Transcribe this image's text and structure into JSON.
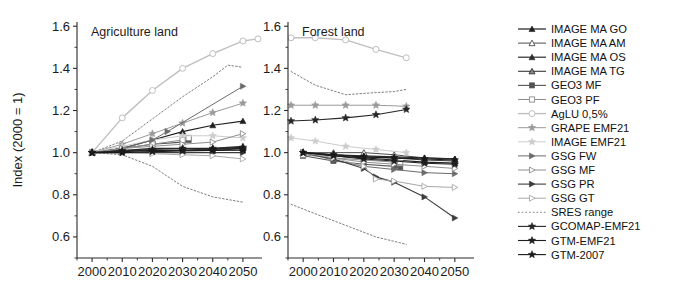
{
  "figure": {
    "ylabel": "Index (2000 = 1)",
    "y_ticks": [
      "0.6",
      "0.8",
      "1.0",
      "1.2",
      "1.4",
      "1.6"
    ],
    "ylim": [
      0.5,
      1.62
    ],
    "xlim": [
      1995,
      2055
    ],
    "x_ticks": [
      "2000",
      "2010",
      "2020",
      "2030",
      "2040",
      "2050"
    ],
    "panels": [
      {
        "id": "agriculture",
        "title": "Agriculture land"
      },
      {
        "id": "forest",
        "title": "Forest land"
      }
    ]
  },
  "legend": {
    "items": [
      {
        "label": "IMAGE MA GO",
        "marker": "triangle-filled",
        "color": "#1f1f1f",
        "line": "solid",
        "lw": 1.2
      },
      {
        "label": "IMAGE MA AM",
        "marker": "triangle-open",
        "color": "#4d4d4d",
        "line": "solid",
        "lw": 1.0
      },
      {
        "label": "IMAGE MA OS",
        "marker": "triangle-filled",
        "color": "#2b2b2b",
        "line": "solid",
        "lw": 1.2
      },
      {
        "label": "IMAGE MA TG",
        "marker": "triangle-half",
        "color": "#3a3a3a",
        "line": "solid",
        "lw": 1.1
      },
      {
        "label": "GEO3 MF",
        "marker": "square-filled",
        "color": "#555555",
        "line": "solid",
        "lw": 1.1
      },
      {
        "label": "GEO3 PF",
        "marker": "square-open",
        "color": "#8c8c8c",
        "line": "solid",
        "lw": 1.0
      },
      {
        "label": "AgLU 0,5%",
        "marker": "circle-open",
        "color": "#bfbfbf",
        "line": "solid",
        "lw": 1.4
      },
      {
        "label": "GRAPE EMF21",
        "marker": "star-grey",
        "color": "#9a9a9a",
        "line": "solid",
        "lw": 1.0
      },
      {
        "label": "IMAGE EMF21",
        "marker": "star-light",
        "color": "#cccccc",
        "line": "solid",
        "lw": 1.0
      },
      {
        "label": "GSG FW",
        "marker": "rtriangle-filled",
        "color": "#6b6b6b",
        "line": "solid",
        "lw": 1.0
      },
      {
        "label": "GSG MF",
        "marker": "rtriangle-open",
        "color": "#8f8f8f",
        "line": "solid",
        "lw": 1.0
      },
      {
        "label": "GSG PR",
        "marker": "rtriangle-filled-dark",
        "color": "#3c3c3c",
        "line": "solid",
        "lw": 1.1
      },
      {
        "label": "GSG GT",
        "marker": "rtriangle-light",
        "color": "#a8a8a8",
        "line": "solid",
        "lw": 1.0
      },
      {
        "label": "SRES range",
        "marker": "none",
        "color": "#6f6f6f",
        "line": "dotted",
        "lw": 0.9
      },
      {
        "label": "GCOMAP-EMF21",
        "marker": "star-filled",
        "color": "#262626",
        "line": "solid",
        "lw": 1.1
      },
      {
        "label": "GTM-EMF21",
        "marker": "star-filled",
        "color": "#1f1f1f",
        "line": "solid",
        "lw": 1.1
      },
      {
        "label": "GTM-2007",
        "marker": "star-filled",
        "color": "#1a1a1a",
        "line": "solid",
        "lw": 1.1
      }
    ]
  },
  "chart_data": {
    "type": "line",
    "title": "",
    "xlabel": "",
    "ylabel": "Index (2000 = 1)",
    "xlim": [
      1995,
      2055
    ],
    "ylim": [
      0.5,
      1.62
    ],
    "grid": false,
    "legend_position": "right",
    "panels": [
      {
        "name": "Agriculture land",
        "series": [
          {
            "name": "IMAGE MA GO",
            "x": [
              2000,
              2010,
              2020,
              2030,
              2040,
              2050
            ],
            "y": [
              1.0,
              1.02,
              1.06,
              1.1,
              1.13,
              1.15
            ]
          },
          {
            "name": "IMAGE MA AM",
            "x": [
              2000,
              2010,
              2020,
              2030,
              2040,
              2050
            ],
            "y": [
              1.0,
              1.01,
              1.01,
              1.01,
              1.02,
              1.02
            ]
          },
          {
            "name": "IMAGE MA OS",
            "x": [
              2000,
              2010,
              2020,
              2030,
              2040,
              2050
            ],
            "y": [
              1.0,
              1.01,
              1.02,
              1.02,
              1.02,
              1.03
            ]
          },
          {
            "name": "IMAGE MA TG",
            "x": [
              2000,
              2010,
              2020,
              2030,
              2040,
              2050
            ],
            "y": [
              1.0,
              1.01,
              1.01,
              1.01,
              1.01,
              1.02
            ]
          },
          {
            "name": "GEO3 MF",
            "x": [
              2000,
              2010,
              2020,
              2030,
              2032
            ],
            "y": [
              1.0,
              1.02,
              1.04,
              1.05,
              1.06
            ]
          },
          {
            "name": "GEO3 PF",
            "x": [
              2000,
              2010,
              2020,
              2030,
              2032
            ],
            "y": [
              1.0,
              1.02,
              1.04,
              1.06,
              1.07
            ]
          },
          {
            "name": "AgLU 0,5%",
            "x": [
              2000,
              2010,
              2020,
              2030,
              2040,
              2050,
              2055
            ],
            "y": [
              1.0,
              1.165,
              1.295,
              1.4,
              1.47,
              1.53,
              1.54
            ]
          },
          {
            "name": "GRAPE EMF21",
            "x": [
              2000,
              2010,
              2020,
              2030,
              2040,
              2050
            ],
            "y": [
              1.0,
              1.04,
              1.09,
              1.14,
              1.19,
              1.235
            ]
          },
          {
            "name": "IMAGE EMF21",
            "x": [
              2000,
              2010,
              2020,
              2030,
              2040,
              2050
            ],
            "y": [
              1.0,
              1.03,
              1.06,
              1.08,
              1.08,
              1.07
            ]
          },
          {
            "name": "GSG FW",
            "x": [
              2000,
              2010,
              2020,
              2025,
              2050
            ],
            "y": [
              1.0,
              1.02,
              1.06,
              1.1,
              1.315
            ]
          },
          {
            "name": "GSG MF",
            "x": [
              2000,
              2010,
              2020,
              2030,
              2040,
              2050
            ],
            "y": [
              1.0,
              1.02,
              1.03,
              1.04,
              1.05,
              1.09
            ]
          },
          {
            "name": "GSG PR",
            "x": [
              2000,
              2010,
              2020,
              2030,
              2040,
              2050
            ],
            "y": [
              1.0,
              1.0,
              1.0,
              1.0,
              1.0,
              1.0
            ]
          },
          {
            "name": "GSG GT",
            "x": [
              2000,
              2010,
              2020,
              2030,
              2040,
              2050
            ],
            "y": [
              1.0,
              1.0,
              0.995,
              0.99,
              0.985,
              0.97
            ]
          },
          {
            "name": "GCOMAP-EMF21",
            "x": [
              2000,
              2010,
              2020,
              2030,
              2040,
              2050
            ],
            "y": [
              1.0,
              1.01,
              1.015,
              1.02,
              1.02,
              1.025
            ]
          },
          {
            "name": "GTM-EMF21",
            "x": [
              2000,
              2010,
              2020,
              2030,
              2040,
              2050
            ],
            "y": [
              1.0,
              1.005,
              1.01,
              1.012,
              1.015,
              1.02
            ]
          },
          {
            "name": "GTM-2007",
            "x": [
              2000,
              2010,
              2020,
              2030,
              2040,
              2050
            ],
            "y": [
              1.0,
              1.0,
              1.005,
              1.008,
              1.01,
              1.012
            ]
          }
        ],
        "sres_range": {
          "upper": {
            "x": [
              2000,
              2010,
              2020,
              2030,
              2040,
              2045,
              2050
            ],
            "y": [
              1.0,
              1.055,
              1.16,
              1.265,
              1.36,
              1.415,
              1.405
            ]
          },
          "lower": {
            "x": [
              2000,
              2010,
              2020,
              2030,
              2040,
              2050
            ],
            "y": [
              1.0,
              0.99,
              0.935,
              0.84,
              0.79,
              0.765
            ]
          }
        }
      },
      {
        "name": "Forest land",
        "series": [
          {
            "name": "IMAGE MA GO",
            "x": [
              2000,
              2010,
              2020,
              2030,
              2040,
              2050
            ],
            "y": [
              1.0,
              0.985,
              0.975,
              0.965,
              0.955,
              0.95
            ]
          },
          {
            "name": "IMAGE MA AM",
            "x": [
              2000,
              2010,
              2020,
              2030,
              2040,
              2050
            ],
            "y": [
              1.0,
              1.0,
              1.0,
              0.99,
              0.975,
              0.97
            ]
          },
          {
            "name": "IMAGE MA OS",
            "x": [
              2000,
              2010,
              2020,
              2030,
              2040,
              2050
            ],
            "y": [
              1.0,
              0.99,
              0.985,
              0.98,
              0.975,
              0.97
            ]
          },
          {
            "name": "IMAGE MA TG",
            "x": [
              2000,
              2010,
              2020,
              2030,
              2040,
              2050
            ],
            "y": [
              1.0,
              0.99,
              0.98,
              0.975,
              0.965,
              0.96
            ]
          },
          {
            "name": "GEO3 MF",
            "x": [
              2000,
              2010,
              2020,
              2030,
              2032
            ],
            "y": [
              0.985,
              0.96,
              0.945,
              0.935,
              0.93
            ]
          },
          {
            "name": "GEO3 PF",
            "x": [
              2000,
              2010,
              2020,
              2030,
              2032
            ],
            "y": [
              0.99,
              0.975,
              0.965,
              0.955,
              0.95
            ]
          },
          {
            "name": "AgLU 0,5%",
            "x": [
              1996,
              2004,
              2014,
              2024,
              2034
            ],
            "y": [
              1.545,
              1.545,
              1.535,
              1.49,
              1.45
            ]
          },
          {
            "name": "GRAPE EMF21",
            "x": [
              1996,
              2004,
              2014,
              2024,
              2034
            ],
            "y": [
              1.225,
              1.225,
              1.225,
              1.225,
              1.22
            ]
          },
          {
            "name": "IMAGE EMF21",
            "x": [
              1996,
              2004,
              2014,
              2024,
              2034
            ],
            "y": [
              1.07,
              1.055,
              1.03,
              1.015,
              1.0
            ]
          },
          {
            "name": "GSG FW",
            "x": [
              2000,
              2010,
              2020,
              2030,
              2040,
              2050
            ],
            "y": [
              1.0,
              0.965,
              0.935,
              0.92,
              0.905,
              0.9
            ]
          },
          {
            "name": "GSG MF",
            "x": [
              2000,
              2010,
              2020,
              2030,
              2040,
              2050
            ],
            "y": [
              1.0,
              0.975,
              0.955,
              0.945,
              0.935,
              0.925
            ]
          },
          {
            "name": "GSG PR",
            "x": [
              2000,
              2010,
              2020,
              2024,
              2030,
              2040,
              2050
            ],
            "y": [
              1.0,
              0.97,
              0.925,
              0.885,
              0.86,
              0.79,
              0.69
            ]
          },
          {
            "name": "GSG GT",
            "x": [
              2000,
              2010,
              2020,
              2024,
              2030,
              2040,
              2050
            ],
            "y": [
              1.0,
              0.975,
              0.935,
              0.875,
              0.865,
              0.84,
              0.835
            ]
          },
          {
            "name": "GCOMAP-EMF21",
            "x": [
              1996,
              2004,
              2014,
              2024,
              2034
            ],
            "y": [
              1.15,
              1.155,
              1.165,
              1.18,
              1.205
            ]
          },
          {
            "name": "GTM-EMF21",
            "x": [
              2000,
              2010,
              2020,
              2030,
              2040,
              2050
            ],
            "y": [
              1.0,
              0.985,
              0.97,
              0.96,
              0.95,
              0.945
            ]
          },
          {
            "name": "GTM-2007",
            "x": [
              2000,
              2010,
              2020,
              2030,
              2040,
              2050
            ],
            "y": [
              1.0,
              0.99,
              0.98,
              0.975,
              0.97,
              0.965
            ]
          }
        ],
        "sres_range": {
          "upper": {
            "x": [
              1996,
              2004,
              2014,
              2024,
              2030,
              2034
            ],
            "y": [
              1.385,
              1.32,
              1.275,
              1.285,
              1.29,
              1.3
            ]
          },
          "lower": {
            "x": [
              1996,
              2004,
              2014,
              2024,
              2034
            ],
            "y": [
              0.755,
              0.71,
              0.655,
              0.6,
              0.565
            ]
          }
        }
      }
    ]
  }
}
